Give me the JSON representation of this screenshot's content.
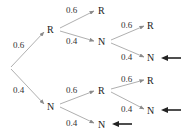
{
  "diagram": {
    "type": "probability-tree",
    "nodes": [
      {
        "id": "root",
        "label": "",
        "x": 10,
        "y": 68
      },
      {
        "id": "R1",
        "label": "R",
        "x": 52,
        "y": 33
      },
      {
        "id": "N1",
        "label": "N",
        "x": 52,
        "y": 109
      },
      {
        "id": "RR",
        "label": "R",
        "x": 103,
        "y": 14
      },
      {
        "id": "RN",
        "label": "N",
        "x": 103,
        "y": 44
      },
      {
        "id": "RNR",
        "label": "R",
        "x": 152,
        "y": 29
      },
      {
        "id": "RNN",
        "label": "N",
        "x": 152,
        "y": 61
      },
      {
        "id": "NR",
        "label": "R",
        "x": 103,
        "y": 94
      },
      {
        "id": "NN",
        "label": "N",
        "x": 103,
        "y": 127
      },
      {
        "id": "NRR",
        "label": "R",
        "x": 152,
        "y": 83
      },
      {
        "id": "NRN",
        "label": "N",
        "x": 152,
        "y": 113
      }
    ],
    "edges": [
      {
        "from": "root",
        "to": "R1",
        "prob": "0.6"
      },
      {
        "from": "root",
        "to": "N1",
        "prob": "0.4"
      },
      {
        "from": "R1",
        "to": "RR",
        "prob": "0.6"
      },
      {
        "from": "R1",
        "to": "RN",
        "prob": "0.4"
      },
      {
        "from": "RN",
        "to": "RNR",
        "prob": "0.6"
      },
      {
        "from": "RN",
        "to": "RNN",
        "prob": "0.4"
      },
      {
        "from": "N1",
        "to": "NR",
        "prob": "0.6"
      },
      {
        "from": "N1",
        "to": "NN",
        "prob": "0.4"
      },
      {
        "from": "NR",
        "to": "NRR",
        "prob": "0.6"
      },
      {
        "from": "NR",
        "to": "NRN",
        "prob": "0.4"
      }
    ],
    "highlighted_outcomes": [
      "RNN",
      "NRN",
      "NN"
    ],
    "labels": {
      "root_to_R": "0.6",
      "root_to_N": "0.4",
      "R_to_R": "0.6",
      "R_to_N": "0.4",
      "RN_to_R": "0.6",
      "RN_to_N": "0.4",
      "N_to_R": "0.6",
      "N_to_N": "0.4",
      "NR_to_R": "0.6",
      "NR_to_N": "0.4"
    },
    "node_labels": {
      "R1": "R",
      "N1": "N",
      "RR": "R",
      "RN": "N",
      "RNR": "R",
      "RNN": "N",
      "NR": "R",
      "NN": "N",
      "NRR": "R",
      "NRN": "N"
    },
    "colors": {
      "edge": "#9a9a9a",
      "text": "#222222",
      "pointer": "#222222"
    }
  }
}
